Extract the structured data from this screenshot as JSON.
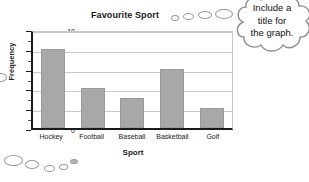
{
  "chart_data": {
    "type": "bar",
    "title": "Favourite Sport",
    "xlabel": "Sport",
    "ylabel": "Frequency",
    "categories": [
      "Hockey",
      "Football",
      "Baseball",
      "Basketball",
      "Golf"
    ],
    "values": [
      8,
      4,
      3,
      6,
      2
    ],
    "ylim": [
      0,
      10
    ],
    "ytick_labels": [
      "0",
      "2",
      "4",
      "6",
      "8",
      "10"
    ],
    "ytick_values": [
      0,
      2,
      4,
      6,
      8,
      10
    ],
    "yminor_values": [
      1,
      3,
      5,
      7,
      9
    ],
    "grid": "horizontal",
    "legend": "none",
    "bar_color": "#a8a8a8",
    "axis_color": "#1a1a1a",
    "grid_color": "#c9c9c9"
  },
  "callout": {
    "line1": "Include a",
    "line2": "title for",
    "line3": "the graph.",
    "outline_color": "#8f8f8f",
    "fill_color": "#ffffff"
  },
  "decor": {
    "trail_color": "#9b9b9b"
  }
}
